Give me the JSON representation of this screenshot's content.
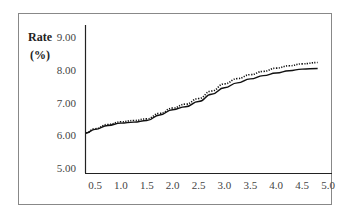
{
  "chart_data": {
    "type": "line",
    "title": "",
    "ylabel": "Rate (%)",
    "ylabel_lines": [
      "Rate",
      "(%)"
    ],
    "xlabel": "",
    "x": [
      0.3,
      0.5,
      0.75,
      1.0,
      1.25,
      1.5,
      1.75,
      2.0,
      2.25,
      2.5,
      2.75,
      3.0,
      3.25,
      3.5,
      3.75,
      4.0,
      4.25,
      4.5,
      4.8
    ],
    "series": [
      {
        "name": "solid",
        "style": "solid",
        "values": [
          6.07,
          6.18,
          6.3,
          6.37,
          6.4,
          6.45,
          6.62,
          6.78,
          6.87,
          7.03,
          7.25,
          7.45,
          7.6,
          7.72,
          7.82,
          7.9,
          7.97,
          8.02,
          8.04
        ]
      },
      {
        "name": "dotted",
        "style": "dotted",
        "values": [
          6.07,
          6.2,
          6.33,
          6.41,
          6.45,
          6.5,
          6.67,
          6.83,
          6.95,
          7.12,
          7.35,
          7.57,
          7.73,
          7.85,
          7.95,
          8.05,
          8.12,
          8.18,
          8.22
        ]
      }
    ],
    "yticks": [
      "5.00",
      "6.00",
      "7.00",
      "8.00",
      "9.00"
    ],
    "xticks": [
      "0.5",
      "1.0",
      "1.5",
      "2.0",
      "2.5",
      "3.0",
      "3.5",
      "4.0",
      "4.5",
      "5.0"
    ],
    "ylim": [
      5.0,
      9.0
    ],
    "xlim": [
      0.3,
      5.0
    ],
    "grid": false,
    "legend": "none"
  }
}
